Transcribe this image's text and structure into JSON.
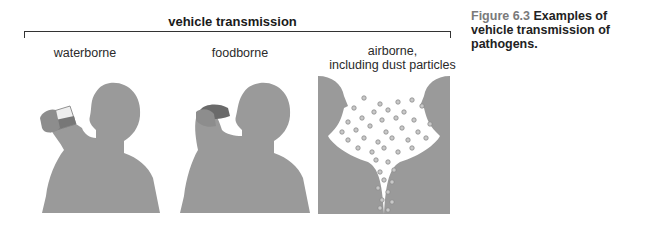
{
  "figure": {
    "title": "vehicle transmission",
    "panels": [
      {
        "id": "waterborne",
        "label": "waterborne"
      },
      {
        "id": "foodborne",
        "label": "foodborne"
      },
      {
        "id": "airborne",
        "label_line1": "airborne,",
        "label_line2": "including dust particles"
      }
    ],
    "caption": {
      "number": "Figure 6.3",
      "text": "Examples of vehicle transmission of pathogens."
    },
    "colors": {
      "silhouette": "#9a9a9a",
      "particle_fill": "#c8c8c8",
      "particle_stroke": "#8a8a8a"
    }
  }
}
